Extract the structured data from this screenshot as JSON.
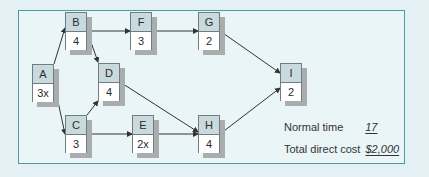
{
  "nodes": {
    "A": {
      "label": "A",
      "duration": "3x"
    },
    "B": {
      "label": "B",
      "duration": "4"
    },
    "C": {
      "label": "C",
      "duration": "3"
    },
    "D": {
      "label": "D",
      "duration": "4"
    },
    "E": {
      "label": "E",
      "duration": "2x"
    },
    "F": {
      "label": "F",
      "duration": "3"
    },
    "G": {
      "label": "G",
      "duration": "2"
    },
    "H": {
      "label": "H",
      "duration": "4"
    },
    "I": {
      "label": "I",
      "duration": "2"
    }
  },
  "edges": [
    [
      "A",
      "B"
    ],
    [
      "A",
      "C"
    ],
    [
      "B",
      "F"
    ],
    [
      "B",
      "D"
    ],
    [
      "F",
      "G"
    ],
    [
      "G",
      "I"
    ],
    [
      "C",
      "D"
    ],
    [
      "C",
      "E"
    ],
    [
      "E",
      "H"
    ],
    [
      "D",
      "H"
    ],
    [
      "H",
      "I"
    ]
  ],
  "summary": {
    "normal_time_label": "Normal time",
    "normal_time_value": "17",
    "total_cost_label": "Total direct cost",
    "total_cost_value": "$2,000"
  },
  "colors": {
    "frame_border": "#4e9a9f",
    "node_header": "#c8dadd",
    "background": "#e3f1f4"
  }
}
